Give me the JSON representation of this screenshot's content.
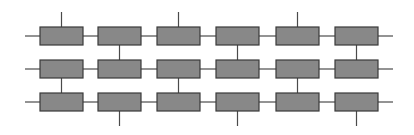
{
  "diagram": {
    "type": "grid-block-network",
    "rows": 3,
    "columns": 6,
    "box": {
      "width": 43,
      "height": 18,
      "fill": "#888888",
      "stroke": "#3a3a3a"
    },
    "wire_color": "#4a4a4a",
    "column_x": [
      40,
      98,
      157,
      216,
      276,
      335
    ],
    "row_y": [
      27,
      60,
      93
    ],
    "left_stub_x": 25,
    "right_stub_x": 393,
    "top_stub_y": 12,
    "bottom_stub_y": 126,
    "top_stub_columns": [
      0,
      2,
      4
    ],
    "row1_row2_link_columns": [
      1,
      3,
      5
    ],
    "row2_row3_link_columns": [
      0,
      2,
      4
    ],
    "bottom_stub_columns": [
      1,
      3,
      5
    ]
  }
}
